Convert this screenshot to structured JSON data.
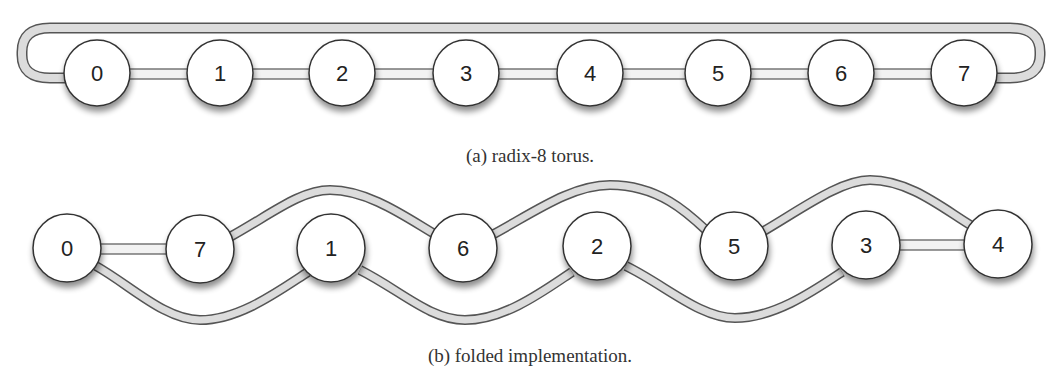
{
  "diagram_a": {
    "caption": "(a) radix-8 torus.",
    "nodes": [
      {
        "label": "0",
        "x": 97,
        "y": 73
      },
      {
        "label": "1",
        "x": 220,
        "y": 73
      },
      {
        "label": "2",
        "x": 342,
        "y": 73
      },
      {
        "label": "3",
        "x": 466,
        "y": 73
      },
      {
        "label": "4",
        "x": 590,
        "y": 73
      },
      {
        "label": "5",
        "x": 718,
        "y": 73
      },
      {
        "label": "6",
        "x": 841,
        "y": 73
      },
      {
        "label": "7",
        "x": 964,
        "y": 73
      }
    ],
    "edges": [
      [
        "0",
        "1"
      ],
      [
        "1",
        "2"
      ],
      [
        "2",
        "3"
      ],
      [
        "3",
        "4"
      ],
      [
        "4",
        "5"
      ],
      [
        "5",
        "6"
      ],
      [
        "6",
        "7"
      ],
      [
        "7",
        "0"
      ]
    ]
  },
  "diagram_b": {
    "caption": "(b) folded implementation.",
    "nodes": [
      {
        "label": "0",
        "x": 67,
        "y": 248
      },
      {
        "label": "7",
        "x": 200,
        "y": 249
      },
      {
        "label": "1",
        "x": 331,
        "y": 248
      },
      {
        "label": "6",
        "x": 463,
        "y": 248
      },
      {
        "label": "2",
        "x": 597,
        "y": 246
      },
      {
        "label": "5",
        "x": 734,
        "y": 246
      },
      {
        "label": "3",
        "x": 866,
        "y": 245
      },
      {
        "label": "4",
        "x": 998,
        "y": 244
      }
    ],
    "edges": [
      [
        "0",
        "7"
      ],
      [
        "0",
        "1"
      ],
      [
        "7",
        "6"
      ],
      [
        "1",
        "2"
      ],
      [
        "6",
        "5"
      ],
      [
        "2",
        "3"
      ],
      [
        "5",
        "4"
      ],
      [
        "3",
        "4"
      ]
    ]
  },
  "colors": {
    "node_fill": "#ffffff",
    "node_stroke": "#333333",
    "link_fill": "#dcdcdc",
    "link_stroke": "#555555"
  }
}
